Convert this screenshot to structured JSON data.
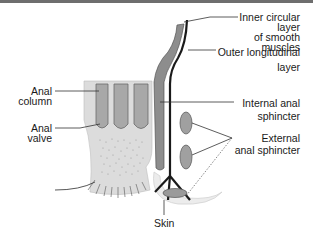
{
  "diagram": {
    "colors": {
      "top_border": "#6e6e6e",
      "tissue_light": "#d9d9d9",
      "column_fill": "#a9a9a9",
      "muscle_dark": "#8a8a8a",
      "black_layer": "#1a1a1a",
      "skin_fill": "#ececec"
    },
    "labels": {
      "inner_circular": [
        "Inner circular",
        "layer",
        "of smooth",
        "muscles"
      ],
      "outer_longitudinal": [
        "Outer longitudinal",
        "layer"
      ],
      "anal_column": [
        "Anal",
        "column"
      ],
      "internal_sphincter": [
        "Internal anal",
        "sphincter"
      ],
      "anal_valve": [
        "Anal",
        "valve"
      ],
      "external_sphincter": [
        "External",
        "anal sphincter"
      ],
      "skin": "Skin"
    }
  }
}
